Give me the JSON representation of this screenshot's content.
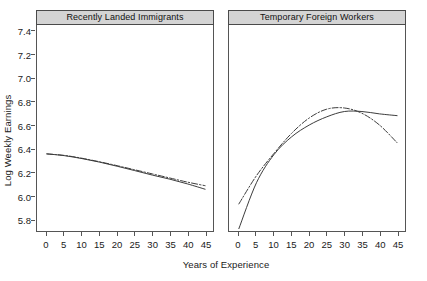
{
  "chart_data": {
    "type": "line",
    "title": "",
    "xlabel": "Years of Experience",
    "ylabel": "Log Weekly Earnings",
    "xlim": [
      0,
      45
    ],
    "ylim": [
      5.7,
      7.45
    ],
    "grid": false,
    "legend_position": "none",
    "xticks": [
      "0",
      "5",
      "10",
      "15",
      "20",
      "25",
      "30",
      "35",
      "40",
      "45"
    ],
    "xtick_values": [
      0,
      5,
      10,
      15,
      20,
      25,
      30,
      35,
      40,
      45
    ],
    "yticks": [
      "5.8",
      "6.0",
      "6.2",
      "6.4",
      "6.6",
      "6.8",
      "7.0",
      "7.2",
      "7.4"
    ],
    "ytick_values": [
      5.8,
      6.0,
      6.2,
      6.4,
      6.6,
      6.8,
      7.0,
      7.2,
      7.4
    ],
    "line_color": "#3a3a3a",
    "panels": [
      {
        "title": "Recently Landed Immigrants",
        "series": [
          {
            "name": "solid",
            "style": "solid",
            "x": [
              0,
              5,
              10,
              15,
              20,
              25,
              30,
              35,
              40,
              45
            ],
            "values": [
              6.355,
              6.34,
              6.315,
              6.285,
              6.25,
              6.213,
              6.175,
              6.14,
              6.1,
              6.055
            ]
          },
          {
            "name": "dash-dot",
            "style": "dashdot",
            "x": [
              0,
              5,
              10,
              15,
              20,
              25,
              30,
              35,
              40,
              45
            ],
            "values": [
              6.355,
              6.342,
              6.318,
              6.288,
              6.255,
              6.22,
              6.185,
              6.15,
              6.115,
              6.085
            ]
          }
        ]
      },
      {
        "title": "Temporary Foreign Workers",
        "series": [
          {
            "name": "solid",
            "style": "solid",
            "x": [
              0,
              5,
              10,
              15,
              20,
              25,
              30,
              35,
              40,
              45
            ],
            "values": [
              5.72,
              6.11,
              6.35,
              6.5,
              6.6,
              6.67,
              6.715,
              6.715,
              6.695,
              6.68
            ]
          },
          {
            "name": "dash-dot",
            "style": "dashdot",
            "x": [
              0,
              5,
              10,
              15,
              20,
              25,
              30,
              35,
              40,
              45
            ],
            "values": [
              5.93,
              6.17,
              6.36,
              6.53,
              6.66,
              6.735,
              6.745,
              6.7,
              6.6,
              6.45
            ]
          }
        ]
      }
    ]
  }
}
